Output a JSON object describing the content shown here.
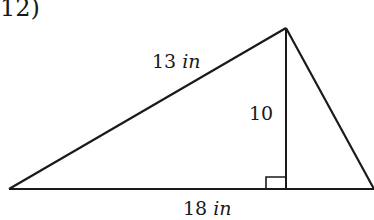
{
  "problem": {
    "number_label": "12)"
  },
  "figure": {
    "type": "triangle",
    "vertices": {
      "left": [
        9,
        189
      ],
      "apex": [
        286,
        28
      ],
      "right": [
        374,
        189
      ]
    },
    "altitude_foot": [
      286,
      189
    ],
    "right_angle_marker": true,
    "stroke_color": "#1a1a1a",
    "labels": {
      "hypotenuse": {
        "value": "13",
        "unit": "in"
      },
      "height": {
        "value": "10",
        "unit": ""
      },
      "base": {
        "value": "18",
        "unit": "in"
      }
    }
  }
}
